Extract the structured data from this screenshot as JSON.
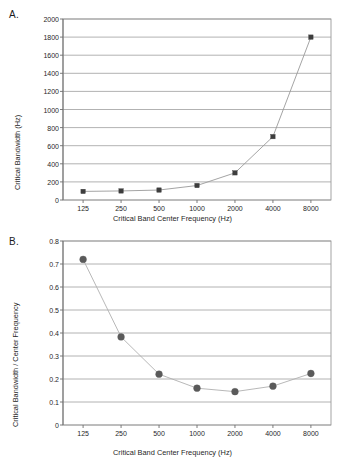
{
  "figure": {
    "background": "#ffffff",
    "panels": [
      {
        "id": "A",
        "label": "A."
      },
      {
        "id": "B",
        "label": "B."
      }
    ]
  },
  "chart_data": [
    {
      "type": "line",
      "panel": "A",
      "title": "",
      "xlabel": "Critical Band Center Frequency (Hz)",
      "ylabel": "Critical Bandwidth (Hz)",
      "x": [
        125,
        250,
        500,
        1000,
        2000,
        4000,
        8000
      ],
      "xtick_labels": [
        "125",
        "250",
        "500",
        "1000",
        "2000",
        "4000",
        "8000"
      ],
      "xscale": "log",
      "values": [
        95,
        100,
        110,
        160,
        300,
        700,
        1800
      ],
      "ylim": [
        0,
        2000
      ],
      "yticks": [
        0,
        200,
        400,
        600,
        800,
        1000,
        1200,
        1400,
        1600,
        1800,
        2000
      ],
      "ytick_labels": [
        "0",
        "200",
        "400",
        "600",
        "800",
        "1000",
        "1200",
        "1400",
        "1600",
        "1800",
        "2000"
      ],
      "grid": "horizontal",
      "legend": "none",
      "marker": "square",
      "marker_size": 2.2,
      "marker_color": "#3d3d3d",
      "line_color": "#9a9a9a",
      "grid_color": "#9e9e9e",
      "axis_color": "#8c8c8c"
    },
    {
      "type": "line",
      "panel": "B",
      "title": "",
      "xlabel": "Critical Band Center Frequency (Hz)",
      "ylabel": "Critical Bandwidth / Center Frequency",
      "x": [
        125,
        250,
        500,
        1000,
        2000,
        4000,
        8000
      ],
      "xtick_labels": [
        "125",
        "250",
        "500",
        "1000",
        "2000",
        "4000",
        "8000"
      ],
      "xscale": "log",
      "values": [
        0.72,
        0.383,
        0.221,
        0.16,
        0.145,
        0.169,
        0.224
      ],
      "ylim": [
        0,
        0.8
      ],
      "yticks": [
        0,
        0.1,
        0.2,
        0.3,
        0.4,
        0.5,
        0.6,
        0.7,
        0.8
      ],
      "ytick_labels": [
        "0",
        "0.1",
        "0.2",
        "0.3",
        "0.4",
        "0.5",
        "0.6",
        "0.7",
        "0.8"
      ],
      "grid": "horizontal",
      "legend": "none",
      "marker": "circle",
      "marker_size": 3.4,
      "marker_color": "#5a5a5a",
      "line_color": "#b0b0b0",
      "grid_color": "#9e9e9e",
      "axis_color": "#8c8c8c"
    }
  ]
}
